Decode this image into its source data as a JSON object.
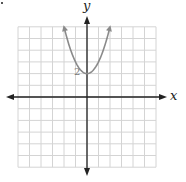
{
  "chart_data": {
    "type": "line",
    "title": "",
    "xlabel": "x",
    "ylabel": "y",
    "xlim": [
      -6,
      6
    ],
    "ylim": [
      -6,
      6
    ],
    "grid": true,
    "function": "y = x^2 + 2",
    "vertex": {
      "x": 0,
      "y": 2
    },
    "annotations": [
      {
        "text": "2",
        "x": 0,
        "y": 2,
        "position": "left of vertex"
      }
    ],
    "series": [
      {
        "name": "parabola",
        "color": "#8a8a8a",
        "x": [
          -2,
          -1.5,
          -1,
          -0.5,
          0,
          0.5,
          1,
          1.5,
          2
        ],
        "y": [
          6,
          4.25,
          3,
          2.25,
          2,
          2.25,
          3,
          4.25,
          6
        ],
        "arrows_at_ends": true
      }
    ]
  },
  "labels": {
    "x_axis": "x",
    "y_axis": "y",
    "vertex_label": "2"
  },
  "colors": {
    "grid": "#d4d4d4",
    "axis": "#222222",
    "curve": "#8a8a8a"
  }
}
